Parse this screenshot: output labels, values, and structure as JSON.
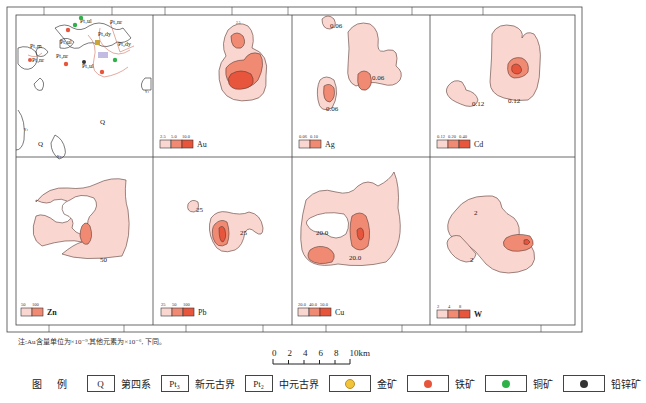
{
  "figure": {
    "colors": {
      "level1": "#f9d6d0",
      "level2": "#f08a72",
      "level3": "#e8553d",
      "outline": "#5a3a34",
      "frame": "#444444"
    },
    "panels": [
      {
        "id": "geology",
        "element": "",
        "legend_values": [],
        "contour_labels": [],
        "geo_labels": [
          "Pt₁ul",
          "Pt₁ul",
          "Pt₂dy",
          "Pt₂dy",
          "Pt₃nr",
          "Pt₂m",
          "Pt₃nr",
          "Pt₁ul",
          "Q",
          "Q",
          "γ₄",
          "γ₄",
          "γ₄"
        ]
      },
      {
        "id": "au",
        "element": "Au",
        "legend_values": [
          "2.5",
          "5.0",
          "10.0"
        ],
        "contour_labels": []
      },
      {
        "id": "ag",
        "element": "Ag",
        "legend_values": [
          "0.06",
          "0.10"
        ],
        "contour_labels": [
          "0.06",
          "0.06",
          "0.06"
        ]
      },
      {
        "id": "cd",
        "element": "Cd",
        "legend_values": [
          "0.12",
          "0.20",
          "0.40"
        ],
        "contour_labels": [
          "0.12",
          "0.12"
        ]
      },
      {
        "id": "zn",
        "element": "Zn",
        "legend_values": [
          "50",
          "100"
        ],
        "contour_labels": [
          "50"
        ]
      },
      {
        "id": "pb",
        "element": "Pb",
        "legend_values": [
          "25",
          "50",
          "100"
        ],
        "contour_labels": [
          "25",
          "25"
        ]
      },
      {
        "id": "cu",
        "element": "Cu",
        "legend_values": [
          "20.0",
          "40.0",
          "50.0"
        ],
        "contour_labels": [
          "20.0",
          "20.0"
        ]
      },
      {
        "id": "w",
        "element": "W",
        "legend_values": [
          "2",
          "4",
          "8"
        ],
        "contour_labels": [
          "2",
          "2"
        ]
      }
    ]
  },
  "note": "注:Au含量单位为×10⁻⁹,其他元素为×10⁻⁶, 下同。",
  "scale": {
    "ticks": [
      "0",
      "2",
      "4",
      "6",
      "8",
      "10km"
    ]
  },
  "legend": {
    "title": "图 例",
    "items": [
      {
        "symbol": "Q",
        "label": "第四系"
      },
      {
        "symbol": "Pt₃",
        "label": "新元古界"
      },
      {
        "symbol": "Pt₂",
        "label": "中元古界"
      },
      {
        "symbol": "gold-ore",
        "label": "金矿",
        "color": "#f2c43a"
      },
      {
        "symbol": "iron-ore",
        "label": "铁矿",
        "color": "#e8553d"
      },
      {
        "symbol": "copper-ore",
        "label": "铜矿",
        "color": "#2fb14a"
      },
      {
        "symbol": "lead-zinc-ore",
        "label": "铅锌矿",
        "color": "#333333"
      }
    ]
  }
}
